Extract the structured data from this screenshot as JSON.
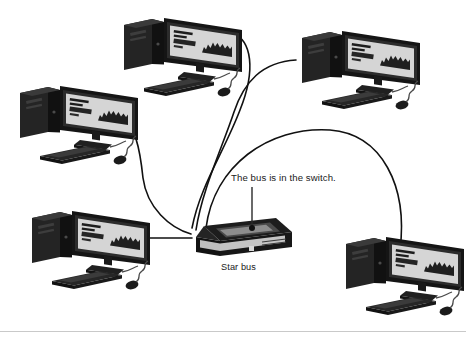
{
  "diagram": {
    "type": "network-topology",
    "topology_name": "Star bus",
    "background_color": "#ffffff",
    "line_color": "#111111",
    "device_dark": "#1c1c1c",
    "device_mid": "#3a3a3a",
    "screen_light": "#d9d9d9",
    "annotations": [
      {
        "id": "switch_note",
        "text": "The bus is in the switch.",
        "x": 231,
        "y": 172
      },
      {
        "id": "switch_caption",
        "text": "Star bus",
        "x": 221,
        "y": 262
      }
    ],
    "central_device": {
      "name": "switch",
      "label": "Star bus",
      "callout": "The bus is in the switch.",
      "x": 196,
      "y": 218,
      "width": 96,
      "height": 44
    },
    "nodes": [
      {
        "id": "pc-top-left",
        "name": "computer-workstation",
        "x": 118,
        "y": 16,
        "scale": 1.0
      },
      {
        "id": "pc-top-right",
        "name": "computer-workstation",
        "x": 296,
        "y": 29,
        "scale": 1.0
      },
      {
        "id": "pc-mid-left",
        "name": "computer-workstation",
        "x": 14,
        "y": 84,
        "scale": 1.0
      },
      {
        "id": "pc-bottom-left",
        "name": "computer-workstation",
        "x": 26,
        "y": 209,
        "scale": 1.0
      },
      {
        "id": "pc-bottom-right",
        "name": "computer-workstation",
        "x": 340,
        "y": 235,
        "scale": 1.0
      }
    ],
    "links": [
      {
        "from": "pc-top-left",
        "to": "switch"
      },
      {
        "from": "pc-top-right",
        "to": "switch"
      },
      {
        "from": "pc-mid-left",
        "to": "switch"
      },
      {
        "from": "pc-bottom-left",
        "to": "switch"
      },
      {
        "from": "pc-bottom-right",
        "to": "switch"
      }
    ],
    "footer_rule": {
      "visible": true,
      "y": 331,
      "color": "#c9c9c9"
    }
  }
}
